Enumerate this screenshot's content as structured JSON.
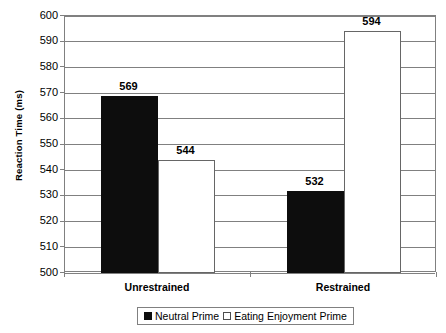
{
  "chart_data": {
    "type": "bar",
    "title": "",
    "xlabel": "",
    "ylabel": "Reaction Time (ms)",
    "ylim": [
      500,
      600
    ],
    "ytick_step": 10,
    "yticks": [
      "600",
      "590",
      "580",
      "570",
      "560",
      "550",
      "540",
      "530",
      "520",
      "510",
      "500"
    ],
    "grid": true,
    "categories": [
      "Unrestrained",
      "Restrained"
    ],
    "legend_position": "bottom-center",
    "series": [
      {
        "name": "Neutral Prime",
        "color": "#0d0d0d",
        "values": [
          569,
          532
        ],
        "value_labels": [
          "569",
          "532"
        ]
      },
      {
        "name": "Eating Enjoyment Prime",
        "color": "#ffffff",
        "values": [
          544,
          594
        ],
        "value_labels": [
          "544",
          "594"
        ]
      }
    ]
  },
  "axes": {
    "y_title": "Reaction Time (ms)"
  },
  "legend": {
    "items": [
      {
        "label": "Neutral Prime",
        "swatch": "dark"
      },
      {
        "label": "Eating Enjoyment Prime",
        "swatch": "light"
      }
    ]
  },
  "colors": {
    "neutral_prime": "#0d0d0d",
    "eating_enjoyment_prime": "#ffffff",
    "gridline": "#808080",
    "axis_text": "#000000",
    "background": "#ffffff"
  }
}
